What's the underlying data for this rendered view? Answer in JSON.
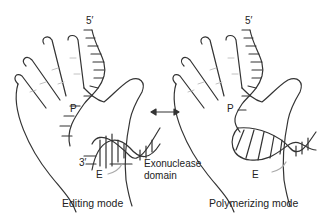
{
  "figure": {
    "left_panel": {
      "caption": "Editing mode",
      "labels": {
        "five_prime": "5′",
        "p_site": "P",
        "three_prime": "3′",
        "e_site": "E",
        "exonuclease_line1": "Exonuclease",
        "exonuclease_line2": "domain"
      }
    },
    "right_panel": {
      "caption": "Polymerizing mode",
      "labels": {
        "five_prime": "5′",
        "p_site": "P",
        "e_site": "E"
      }
    },
    "connector": "double-headed-arrow",
    "colors": {
      "line": "#333333",
      "finger_crease": "#bbbbbb",
      "background": "#ffffff"
    }
  }
}
